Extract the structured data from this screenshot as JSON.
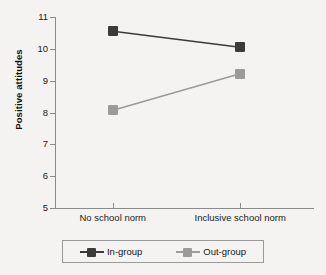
{
  "chart_data": {
    "type": "line",
    "title": "",
    "xlabel": "",
    "ylabel": "Positive attitudes",
    "categories": [
      "No school norm",
      "Inclusive school norm"
    ],
    "ylim": [
      5,
      11
    ],
    "yticks": [
      11,
      10,
      9,
      8,
      7,
      6,
      5
    ],
    "ytick_labels": [
      "11",
      "10",
      "9",
      "8",
      "7",
      "6",
      "5"
    ],
    "grid": false,
    "legend_position": "bottom",
    "series": [
      {
        "name": "In-group",
        "values": [
          10.55,
          10.05
        ],
        "color": "#3b3b3b",
        "marker": "square"
      },
      {
        "name": "Out-group",
        "values": [
          8.07,
          9.22
        ],
        "color": "#9b9b9b",
        "marker": "square"
      }
    ]
  },
  "axes": {
    "y_title": "Positive attitudes",
    "y_tick_labels": [
      "11",
      "10",
      "9",
      "8",
      "7",
      "6",
      "5"
    ],
    "x_tick_labels": [
      "No school norm",
      "Inclusive school norm"
    ]
  },
  "legend": {
    "entries": [
      {
        "label": "In-group",
        "color": "#3b3b3b"
      },
      {
        "label": "Out-group",
        "color": "#9b9b9b"
      }
    ]
  }
}
